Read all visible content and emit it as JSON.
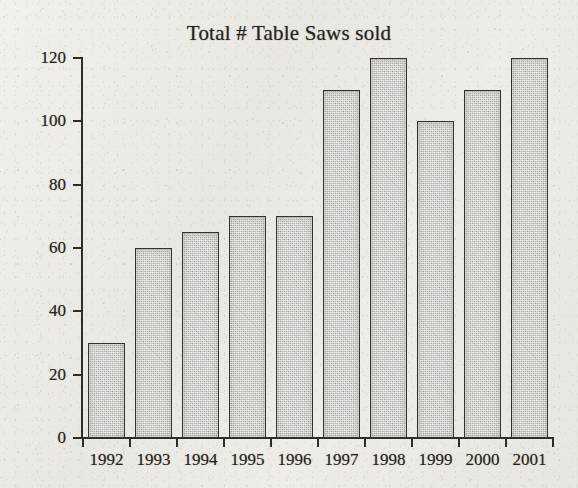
{
  "chart_data": {
    "type": "bar",
    "title": "Total # Table Saws sold",
    "xlabel": "",
    "ylabel": "",
    "categories": [
      "1992",
      "1993",
      "1994",
      "1995",
      "1996",
      "1997",
      "1998",
      "1999",
      "2000",
      "2001"
    ],
    "values": [
      30,
      60,
      65,
      70,
      70,
      110,
      120,
      100,
      110,
      120
    ],
    "ylim": [
      0,
      120
    ],
    "ytick_labels": [
      "0",
      "20",
      "40",
      "60",
      "80",
      "100",
      "120"
    ],
    "ytick_values": [
      0,
      20,
      40,
      60,
      80,
      100,
      120
    ],
    "grid": false,
    "legend": "none",
    "bar_fill_color": "#b6b4af",
    "bar_border_color": "#33312b",
    "background_color": "#eceae5",
    "text_color": "#26241f"
  }
}
